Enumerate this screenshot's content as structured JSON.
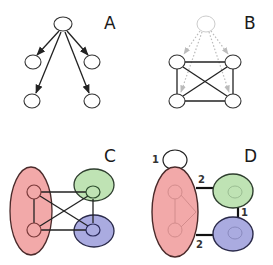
{
  "figure": {
    "panels": [
      {
        "id": "A",
        "label": "A",
        "kind": "directed-tree",
        "nodes": [
          "root",
          "l1",
          "r1",
          "l2",
          "r2"
        ],
        "edges": [
          {
            "from": "root",
            "to": "l1",
            "directed": true
          },
          {
            "from": "root",
            "to": "r1",
            "directed": true
          },
          {
            "from": "root",
            "to": "l2",
            "directed": true
          },
          {
            "from": "root",
            "to": "r2",
            "directed": true
          }
        ]
      },
      {
        "id": "B",
        "label": "B",
        "kind": "moralized-complete-graph",
        "nodes": [
          "root-faded",
          "tl",
          "tr",
          "bl",
          "br"
        ],
        "faded_edges": [
          {
            "from": "root-faded",
            "to": "tl"
          },
          {
            "from": "root-faded",
            "to": "tr"
          },
          {
            "from": "root-faded",
            "to": "bl"
          },
          {
            "from": "root-faded",
            "to": "br"
          }
        ],
        "edges": [
          {
            "from": "tl",
            "to": "tr"
          },
          {
            "from": "bl",
            "to": "br"
          },
          {
            "from": "tl",
            "to": "bl"
          },
          {
            "from": "tr",
            "to": "br"
          },
          {
            "from": "tl",
            "to": "br"
          },
          {
            "from": "tr",
            "to": "bl"
          }
        ]
      },
      {
        "id": "C",
        "label": "C",
        "kind": "grouped-graph",
        "groups": [
          {
            "name": "red",
            "color": "#f2a9a9",
            "members": [
              "tl",
              "bl"
            ]
          },
          {
            "name": "green",
            "color": "#bfe3b4",
            "members": [
              "tr"
            ]
          },
          {
            "name": "blue",
            "color": "#aaabe0",
            "members": [
              "br"
            ]
          }
        ]
      },
      {
        "id": "D",
        "label": "D",
        "kind": "condensed-weighted-graph",
        "supernodes": [
          {
            "name": "red",
            "color": "#f2a9a9"
          },
          {
            "name": "green",
            "color": "#bfe3b4"
          },
          {
            "name": "blue",
            "color": "#aaabe0"
          }
        ],
        "weighted_edges": [
          {
            "from": "red",
            "to": "red",
            "weight": "1",
            "self_loop": true
          },
          {
            "from": "red",
            "to": "green",
            "weight": "2"
          },
          {
            "from": "green",
            "to": "blue",
            "weight": "1"
          },
          {
            "from": "red",
            "to": "blue",
            "weight": "2"
          }
        ]
      }
    ]
  },
  "labels": {
    "a": "A",
    "b": "B",
    "c": "C",
    "d": "D",
    "d_loop_weight": "1",
    "d_red_green_weight": "2",
    "d_green_blue_weight": "1",
    "d_red_blue_weight": "2"
  },
  "colors": {
    "red_group": "#f2a9a9",
    "red_group_stroke": "#4a2a2a",
    "green_group": "#bfe3b4",
    "green_group_stroke": "#2f3f2f",
    "blue_group": "#aaabe0",
    "blue_group_stroke": "#2a2a4a"
  }
}
